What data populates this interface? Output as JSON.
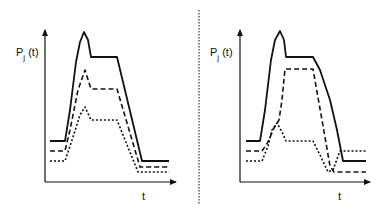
{
  "figure": {
    "panels": [
      {
        "id": "left",
        "ylabel_main": "P",
        "ylabel_sub": "j",
        "ylabel_suffix": " (t)",
        "xlabel": "t",
        "curves": [
          {
            "style": "solid",
            "points": "50,141 65,141 70,110 76,62 80,42 84,32 88,40 91,57 117,57 142,161 169,161"
          },
          {
            "style": "dashed",
            "points": "50,151 65,151 70,130 78,90 85,70 91,89 117,89 140,167 169,167"
          },
          {
            "style": "dotted",
            "points": "50,161 65,161 72,140 80,115 85,107 91,120 117,120 138,172 169,172"
          }
        ]
      },
      {
        "id": "right",
        "ylabel_main": "P",
        "ylabel_sub": "j",
        "ylabel_suffix": " (t)",
        "xlabel": "t",
        "curves": [
          {
            "style": "solid",
            "points": "246,141 260,141 265,110 271,60 275,40 280,31 284,40 286,57 313,57 320,70 330,100 337,130 343,161 366,161"
          },
          {
            "style": "dashed",
            "points": "246,151 262,151 268,142 274,128 279,120 282,100 285,69 313,69 322,120 330,166 334,172 366,172"
          },
          {
            "style": "dotted",
            "points": "246,161 262,161 268,146 272,130 277,123 282,132 286,141 313,141 320,155 328,172 333,170 340,151 366,151"
          }
        ]
      }
    ],
    "divider": {
      "style": "dotted",
      "x": 199
    }
  }
}
